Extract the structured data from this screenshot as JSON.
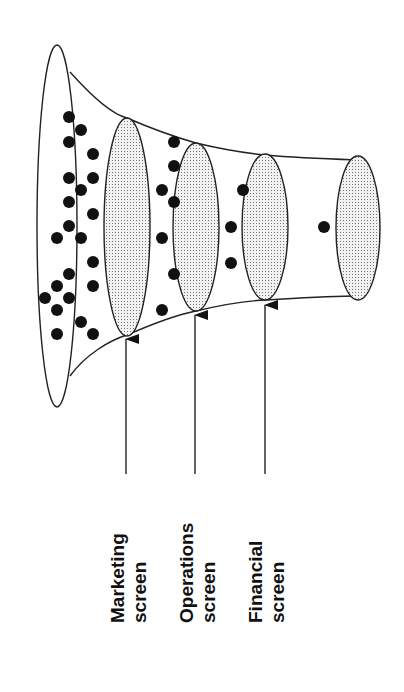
{
  "diagram": {
    "labels": [
      {
        "line1": "Marketing",
        "line2": "screen"
      },
      {
        "line1": "Operations",
        "line2": "screen"
      },
      {
        "line1": "Financial",
        "line2": "screen"
      }
    ],
    "stages": [
      {
        "name": "marketing-screen",
        "cx": 127,
        "cy": 227,
        "rx": 23,
        "ry": 109
      },
      {
        "name": "operations-screen",
        "cx": 196,
        "cy": 227,
        "rx": 23,
        "ry": 84
      },
      {
        "name": "financial-screen",
        "cx": 265,
        "cy": 227,
        "rx": 23,
        "ry": 73
      },
      {
        "name": "output",
        "cx": 358,
        "cy": 227,
        "rx": 22,
        "ry": 72
      }
    ],
    "candidate_counts": {
      "before_marketing": 23,
      "before_operations": 7,
      "before_financial": 3,
      "after_financial": 1
    },
    "colors": {
      "stroke": "#222222",
      "dot": "#111111",
      "fill": "#ffffff"
    }
  }
}
